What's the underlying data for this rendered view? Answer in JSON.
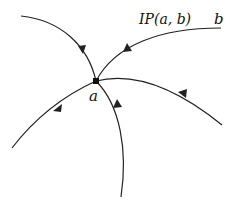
{
  "diagram": {
    "type": "vector-field-flow",
    "node": {
      "label": "a",
      "x": 96,
      "y": 81
    },
    "endpoint": {
      "label": "b"
    },
    "path_label": "IP(a, b)",
    "stroke_color": "#222222",
    "curves": [
      {
        "name": "upper-left-incoming",
        "direction": "toward a"
      },
      {
        "name": "ip-path-from-b",
        "direction": "toward a"
      },
      {
        "name": "right-incoming",
        "direction": "toward a"
      },
      {
        "name": "lower-left-incoming",
        "direction": "toward a"
      },
      {
        "name": "bottom-incoming",
        "direction": "toward a"
      }
    ]
  }
}
